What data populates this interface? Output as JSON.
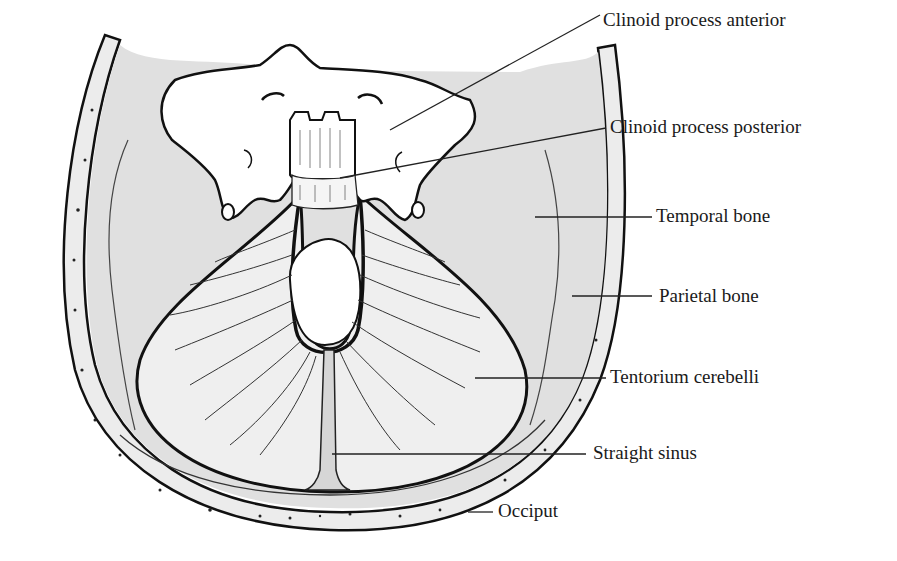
{
  "diagram": {
    "colors": {
      "bone_fill": "#e3e3e3",
      "tentorium_fill": "#efefef",
      "outline": "#111111",
      "background": "#ffffff"
    },
    "labels": [
      {
        "id": "clinoid-anterior",
        "text": "Clinoid process anterior"
      },
      {
        "id": "clinoid-posterior",
        "text": "Clinoid process posterior"
      },
      {
        "id": "temporal-bone",
        "text": "Temporal bone"
      },
      {
        "id": "parietal-bone",
        "text": "Parietal bone"
      },
      {
        "id": "tentorium-cerebelli",
        "text": "Tentorium cerebelli"
      },
      {
        "id": "straight-sinus",
        "text": "Straight sinus"
      },
      {
        "id": "occiput",
        "text": "Occiput"
      }
    ]
  }
}
